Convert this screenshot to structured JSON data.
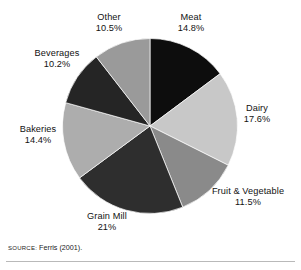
{
  "chart_data": {
    "type": "pie",
    "title": "",
    "subtitle": "",
    "xlabel": "",
    "ylabel": "",
    "legend_position": "outside-labels",
    "grid": false,
    "start_angle_deg": 0,
    "direction": "clockwise",
    "unit": "%",
    "categories": [
      "Meat",
      "Dairy",
      "Fruit & Vegetable",
      "Grain Mill",
      "Bakeries",
      "Beverages",
      "Other"
    ],
    "values": [
      14.8,
      17.6,
      11.5,
      21,
      14.4,
      10.2,
      10.5
    ],
    "slices": [
      {
        "name": "Meat",
        "value": 14.8,
        "value_text": "14.8%",
        "color": "#0d0d0d"
      },
      {
        "name": "Dairy",
        "value": 17.6,
        "value_text": "17.6%",
        "color": "#c8c8c8"
      },
      {
        "name": "Fruit & Vegetable",
        "value": 11.5,
        "value_text": "11.5%",
        "color": "#8a8a8a"
      },
      {
        "name": "Grain Mill",
        "value": 21.0,
        "value_text": "21%",
        "color": "#2e2e2e"
      },
      {
        "name": "Bakeries",
        "value": 14.4,
        "value_text": "14.4%",
        "color": "#adadad"
      },
      {
        "name": "Beverages",
        "value": 10.2,
        "value_text": "10.2%",
        "color": "#252525"
      },
      {
        "name": "Other",
        "value": 10.5,
        "value_text": "10.5%",
        "color": "#9a9a9a"
      }
    ]
  },
  "labels": {
    "meat": {
      "name": "Meat",
      "value": "14.8%"
    },
    "dairy": {
      "name": "Dairy",
      "value": "17.6%"
    },
    "fruitveg": {
      "name": "Fruit & Vegetable",
      "value": "11.5%"
    },
    "grainmill": {
      "name": "Grain Mill",
      "value": "21%"
    },
    "bakeries": {
      "name": "Bakeries",
      "value": "14.4%"
    },
    "beverages": {
      "name": "Beverages",
      "value": "10.2%"
    },
    "other": {
      "name": "Other",
      "value": "10.5%"
    }
  },
  "source": {
    "label": "SOURCE:",
    "text": "Ferris (2001)."
  }
}
